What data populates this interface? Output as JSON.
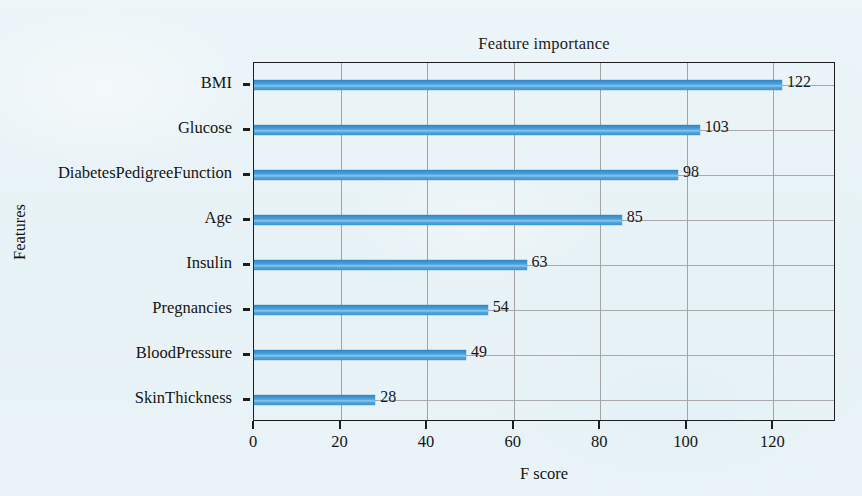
{
  "chart_data": {
    "type": "bar",
    "orientation": "horizontal",
    "title": "Feature importance",
    "xlabel": "F score",
    "ylabel": "Features",
    "categories": [
      "BMI",
      "Glucose",
      "DiabetesPedigreeFunction",
      "Age",
      "Insulin",
      "Pregnancies",
      "BloodPressure",
      "SkinThickness"
    ],
    "values": [
      122,
      103,
      98,
      85,
      63,
      54,
      49,
      28
    ],
    "value_labels": [
      "122",
      "103",
      "98",
      "85",
      "63",
      "54",
      "49",
      "28"
    ],
    "xlim": [
      0,
      134.5
    ],
    "xticks": [
      0,
      20,
      40,
      60,
      80,
      100,
      120
    ],
    "xtick_labels": [
      "0",
      "20",
      "40",
      "60",
      "80",
      "100",
      "120"
    ],
    "grid": "both",
    "legend": "none",
    "bar_color": "#3c94d0",
    "bar_color_dark": "#2f86c6",
    "grid_color": "#a6a6a6",
    "axis_color": "#1d1d1d",
    "background_color": "#eaf4f8",
    "text_color": "#141414"
  }
}
